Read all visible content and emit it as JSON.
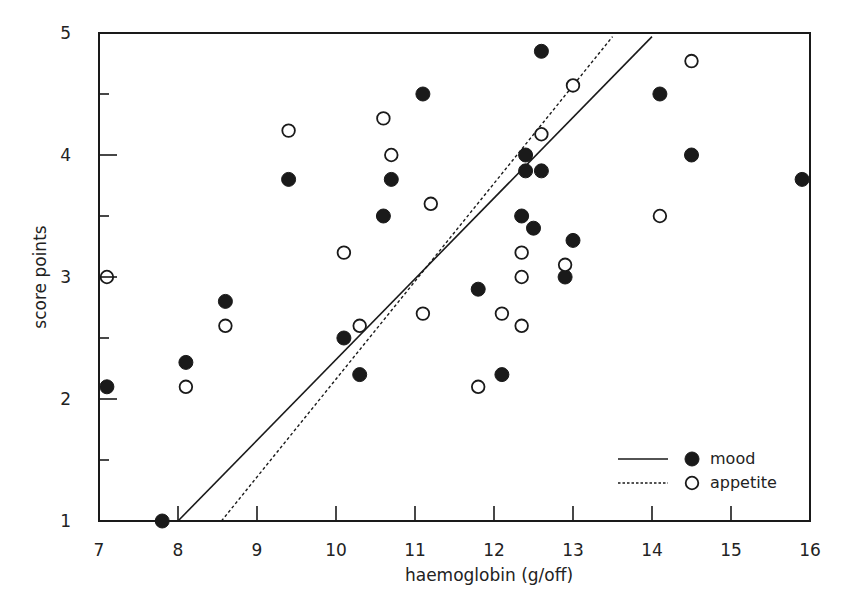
{
  "chart_data": {
    "type": "scatter",
    "title": "",
    "xlabel": "haemoglobin (g/off)",
    "ylabel": "score points",
    "xlim": [
      7,
      16
    ],
    "ylim": [
      1,
      5
    ],
    "x_ticks": [
      7,
      8,
      9,
      10,
      11,
      12,
      13,
      14,
      15,
      16
    ],
    "x_tick_labels": [
      "7",
      "8",
      "9",
      "10",
      "11",
      "12",
      "13",
      "14",
      "15",
      "16"
    ],
    "y_ticks": [
      1,
      2,
      3,
      4,
      5
    ],
    "y_tick_labels": [
      "1",
      "2",
      "3",
      "4",
      "5"
    ],
    "y_minor_ticks": [
      1.5,
      2.5,
      3.5,
      4.5
    ],
    "grid": false,
    "legend_position": "lower right",
    "series": [
      {
        "name": "mood",
        "marker": "filled-circle",
        "line_style": "solid",
        "color": "#1a1a1a",
        "points": [
          [
            7.1,
            2.1
          ],
          [
            7.8,
            1.0
          ],
          [
            8.1,
            2.3
          ],
          [
            8.6,
            2.8
          ],
          [
            9.4,
            3.8
          ],
          [
            10.1,
            2.5
          ],
          [
            10.3,
            2.2
          ],
          [
            10.6,
            3.5
          ],
          [
            10.7,
            3.8
          ],
          [
            11.1,
            4.5
          ],
          [
            11.8,
            2.9
          ],
          [
            12.1,
            2.2
          ],
          [
            12.35,
            3.5
          ],
          [
            12.4,
            4.0
          ],
          [
            12.4,
            3.87
          ],
          [
            12.5,
            3.4
          ],
          [
            12.6,
            3.87
          ],
          [
            12.6,
            4.85
          ],
          [
            12.9,
            3.0
          ],
          [
            13.0,
            3.3
          ],
          [
            14.1,
            4.5
          ],
          [
            14.5,
            4.0
          ],
          [
            15.9,
            3.8
          ]
        ],
        "regression_line": [
          [
            8.0,
            1.0
          ],
          [
            14.0,
            4.97
          ]
        ]
      },
      {
        "name": "appetite",
        "marker": "open-circle",
        "line_style": "dotted",
        "color": "#1a1a1a",
        "points": [
          [
            7.1,
            3.0
          ],
          [
            8.1,
            2.1
          ],
          [
            8.6,
            2.6
          ],
          [
            9.4,
            4.2
          ],
          [
            10.1,
            3.2
          ],
          [
            10.3,
            2.6
          ],
          [
            10.6,
            4.3
          ],
          [
            10.7,
            4.0
          ],
          [
            11.1,
            2.7
          ],
          [
            11.2,
            3.6
          ],
          [
            11.8,
            2.1
          ],
          [
            12.1,
            2.7
          ],
          [
            12.35,
            3.2
          ],
          [
            12.35,
            3.0
          ],
          [
            12.35,
            2.6
          ],
          [
            12.6,
            4.17
          ],
          [
            12.9,
            3.1
          ],
          [
            13.0,
            4.57
          ],
          [
            14.1,
            3.5
          ],
          [
            14.5,
            4.77
          ]
        ],
        "regression_line": [
          [
            8.55,
            1.0
          ],
          [
            13.5,
            4.97
          ]
        ]
      }
    ]
  },
  "legend": {
    "items": [
      {
        "label": "mood",
        "line_style": "solid",
        "marker": "filled-circle"
      },
      {
        "label": "appetite",
        "line_style": "dotted",
        "marker": "open-circle"
      }
    ]
  }
}
